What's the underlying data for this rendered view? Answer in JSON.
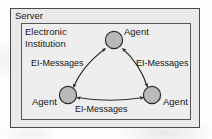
{
  "diagram": {
    "title": "Server",
    "outer_container": {
      "label": "Server"
    },
    "inner_container": {
      "label": "Electronic\nInstitution",
      "label_line1": "Electronic",
      "label_line2": "Institution"
    },
    "nodes": [
      {
        "id": "agent-top",
        "label": "Agent",
        "shape": "circle",
        "position": "top"
      },
      {
        "id": "agent-left",
        "label": "Agent",
        "shape": "circle",
        "position": "bottom-left"
      },
      {
        "id": "agent-right",
        "label": "Agent",
        "shape": "circle",
        "position": "bottom-right"
      }
    ],
    "edges": [
      {
        "id": "edge-left",
        "label": "EI-Messages",
        "from": "agent-left",
        "to": "agent-top",
        "direction": "bidirectional"
      },
      {
        "id": "edge-right",
        "label": "EI-Messages",
        "from": "agent-top",
        "to": "agent-right",
        "direction": "bidirectional"
      },
      {
        "id": "edge-bottom",
        "label": "EI-Messages",
        "from": "agent-left",
        "to": "agent-right",
        "direction": "bidirectional"
      }
    ],
    "colors": {
      "node_fill": "#b9b9b9",
      "node_stroke": "#2b2b2b",
      "edge_stroke": "#2e2e2e",
      "outer_fill": "#e9e9e9",
      "outer_stroke": "#4a4a4a",
      "inner_fill": "#eeeeee",
      "inner_stroke": "#55565a",
      "text": "#141414",
      "page_background": "#fdfdfd"
    }
  }
}
